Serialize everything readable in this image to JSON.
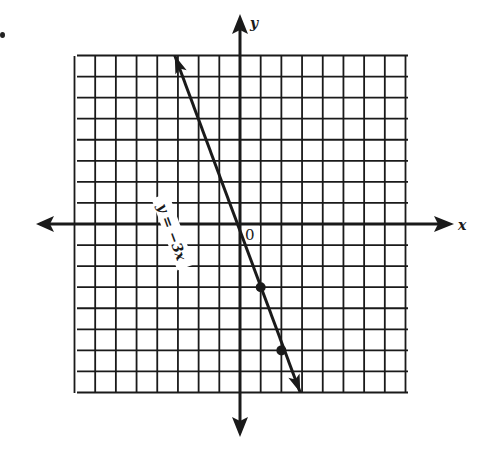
{
  "figure": {
    "type": "coordinate-grid-line-graph",
    "item_marker": "•",
    "axes": {
      "x_label": "x",
      "y_label": "y",
      "origin_label": "0"
    },
    "grid": {
      "x_min": -8,
      "x_max": 8,
      "y_min": -8,
      "y_max": 8,
      "step": 1
    },
    "line": {
      "equation_label": "y = −3x",
      "slope": -3,
      "intercept": 0,
      "start": [
        -2.67,
        8
      ],
      "end": [
        2.67,
        -8
      ]
    },
    "points": [
      {
        "x": 1,
        "y": -3
      },
      {
        "x": 2,
        "y": -6
      }
    ],
    "colors": {
      "ink": "#1a1a1a",
      "paper": "#ffffff"
    }
  },
  "chart_data": {
    "type": "line",
    "title": "",
    "xlabel": "x",
    "ylabel": "y",
    "xlim": [
      -8,
      8
    ],
    "ylim": [
      -8,
      8
    ],
    "grid": true,
    "series": [
      {
        "name": "y = −3x",
        "x": [
          -2.67,
          0,
          1,
          2,
          2.67
        ],
        "y": [
          8,
          0,
          -3,
          -6,
          -8
        ]
      }
    ],
    "marked_points": [
      [
        1,
        -3
      ],
      [
        2,
        -6
      ]
    ],
    "annotations": [
      "y = −3x",
      "0"
    ]
  }
}
